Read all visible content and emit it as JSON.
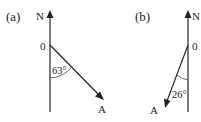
{
  "diagrams": [
    {
      "label": "(a)",
      "north_label": "N",
      "origin_label": "0",
      "point_label": "A",
      "angle_label": "63°",
      "bearing_deg": 117
    },
    {
      "label": "(b)",
      "north_label": "N",
      "origin_label": "0",
      "point_label": "A",
      "angle_label": "26°",
      "bearing_deg": 206
    }
  ],
  "colors": {
    "ink": "#222222",
    "background": "#ffffff"
  }
}
